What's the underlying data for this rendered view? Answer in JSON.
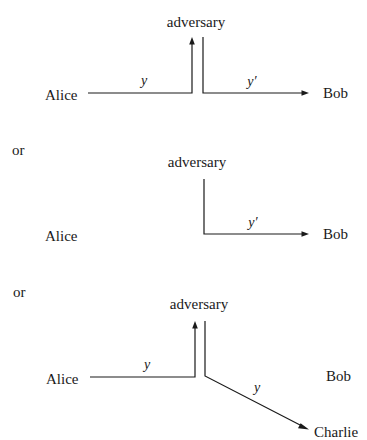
{
  "panels": [
    {
      "id": "panel-1",
      "nodes": {
        "sender": "Alice",
        "adversary": "adversary",
        "receiver": "Bob"
      },
      "edges": [
        {
          "from": "Alice",
          "to": "adversary",
          "label": "y"
        },
        {
          "from": "adversary",
          "to": "Bob",
          "label": "y′"
        }
      ]
    },
    {
      "id": "panel-2",
      "separator": "or",
      "nodes": {
        "sender": "Alice",
        "adversary": "adversary",
        "receiver": "Bob"
      },
      "edges": [
        {
          "from": "adversary",
          "to": "Bob",
          "label": "y′"
        }
      ]
    },
    {
      "id": "panel-3",
      "separator": "or",
      "nodes": {
        "sender": "Alice",
        "adversary": "adversary",
        "receiver": "Bob",
        "third_party": "Charlie"
      },
      "edges": [
        {
          "from": "Alice",
          "to": "adversary",
          "label": "y"
        },
        {
          "from": "adversary",
          "to": "Charlie",
          "label": "y"
        }
      ]
    }
  ],
  "colors": {
    "ink": "#1a1a1a",
    "background": "#ffffff"
  }
}
